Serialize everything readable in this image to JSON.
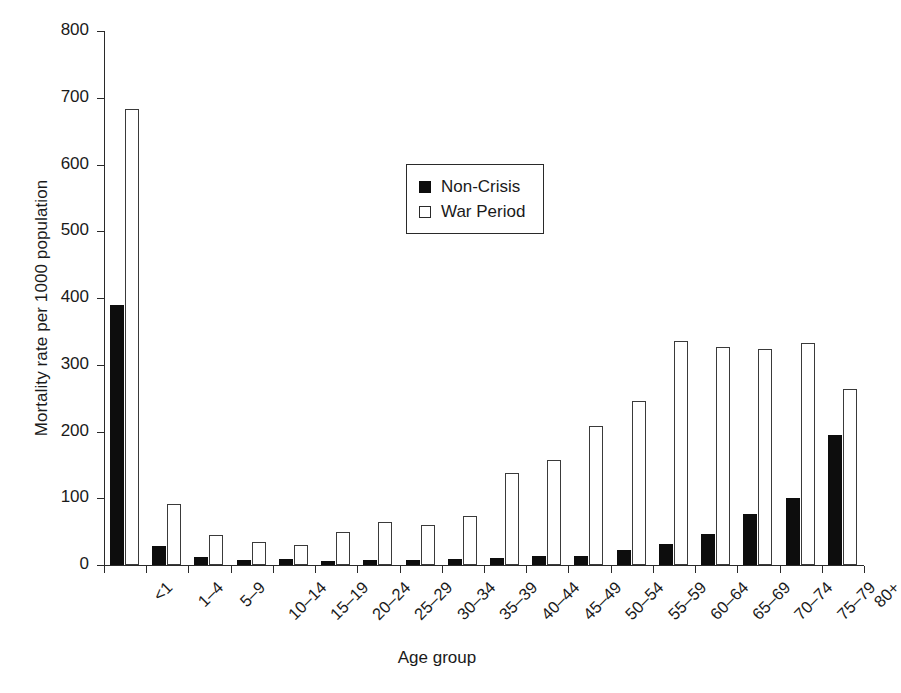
{
  "chart_data": {
    "type": "bar",
    "title": "",
    "xlabel": "Age group",
    "ylabel": "Mortality rate per 1000 population",
    "ylim": [
      0,
      800
    ],
    "yticks": [
      0,
      100,
      200,
      300,
      400,
      500,
      600,
      700,
      800
    ],
    "grid": false,
    "legend_position": "upper center",
    "categories": [
      "<1",
      "1–4",
      "5–9",
      "10–14",
      "15–19",
      "20–24",
      "25–29",
      "30–34",
      "35–39",
      "40–44",
      "45–49",
      "50–54",
      "55–59",
      "60–64",
      "65–69",
      "70–74",
      "75–79",
      "80+"
    ],
    "series": [
      {
        "name": "Non-Crisis",
        "color": "#0d0d0d",
        "style": "filled",
        "values": [
          389,
          29,
          12,
          7,
          9,
          6,
          8,
          7,
          9,
          11,
          13,
          14,
          23,
          31,
          46,
          76,
          100,
          195
        ]
      },
      {
        "name": "War Period",
        "color": "#ffffff",
        "style": "open",
        "values": [
          683,
          91,
          45,
          34,
          30,
          50,
          64,
          60,
          73,
          138,
          158,
          209,
          245,
          335,
          326,
          323,
          333,
          263
        ]
      }
    ]
  },
  "legend": {
    "items": [
      {
        "label": "Non-Crisis",
        "swatch": "filled-square"
      },
      {
        "label": "War Period",
        "swatch": "open-square"
      }
    ]
  },
  "axes": {
    "y_title": "Mortality rate per 1000 population",
    "x_title": "Age group",
    "y_tick_labels": [
      "0",
      "100",
      "200",
      "300",
      "400",
      "500",
      "600",
      "700",
      "800"
    ],
    "x_tick_labels": [
      "<1",
      "1–4",
      "5–9",
      "10–14",
      "15–19",
      "20–24",
      "25–29",
      "30–34",
      "35–39",
      "40–44",
      "45–49",
      "50–54",
      "55–59",
      "60–64",
      "65–69",
      "70–74",
      "75–79",
      "80+"
    ]
  },
  "colors": {
    "non_crisis": "#0d0d0d",
    "war_period": "#ffffff",
    "axis": "#2a2a2a",
    "background": "#ffffff"
  }
}
